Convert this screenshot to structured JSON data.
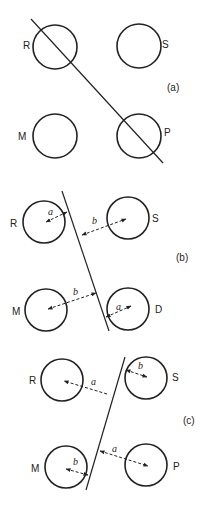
{
  "panels": [
    {
      "tag": "(a)",
      "circles": [
        {
          "label": "R"
        },
        {
          "label": "S"
        },
        {
          "label": "M"
        },
        {
          "label": "P"
        }
      ]
    },
    {
      "tag": "(b)",
      "circles": [
        {
          "label": "R"
        },
        {
          "label": "S"
        },
        {
          "label": "M"
        },
        {
          "label": "D"
        }
      ],
      "distances": [
        "a",
        "b",
        "b",
        "a"
      ]
    },
    {
      "tag": "(c)",
      "circles": [
        {
          "label": "R"
        },
        {
          "label": "S"
        },
        {
          "label": "M"
        },
        {
          "label": "P"
        }
      ],
      "distances": [
        "a",
        "b",
        "b",
        "a"
      ]
    }
  ]
}
